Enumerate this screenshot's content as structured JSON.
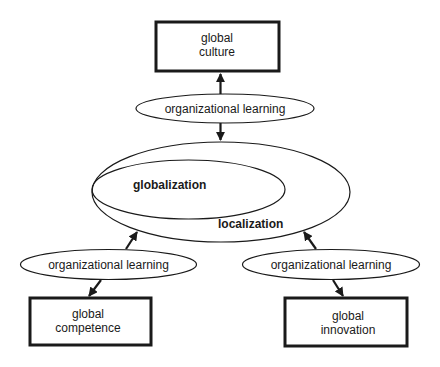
{
  "diagram": {
    "colors": {
      "stroke": "#1a1a1a",
      "fill": "#ffffff",
      "text": "#1a1a1a"
    },
    "nodes": {
      "global_culture": {
        "line1": "global",
        "line2": "culture"
      },
      "global_competence": {
        "line1": "global",
        "line2": "competence"
      },
      "global_innovation": {
        "line1": "global",
        "line2": "innovation"
      },
      "org_learning_top": {
        "label": "organizational learning"
      },
      "org_learning_left": {
        "label": "organizational learning"
      },
      "org_learning_right": {
        "label": "organizational learning"
      },
      "localization": {
        "label": "localization"
      },
      "globalization": {
        "label": "globalization"
      }
    },
    "edges": [
      {
        "from": "organizational learning (top)",
        "to": "global culture"
      },
      {
        "from": "organizational learning (top)",
        "to": "localization"
      },
      {
        "from": "organizational learning (left)",
        "to": "localization"
      },
      {
        "from": "organizational learning (left)",
        "to": "global competence"
      },
      {
        "from": "organizational learning (right)",
        "to": "localization"
      },
      {
        "from": "organizational learning (right)",
        "to": "global innovation"
      }
    ]
  }
}
